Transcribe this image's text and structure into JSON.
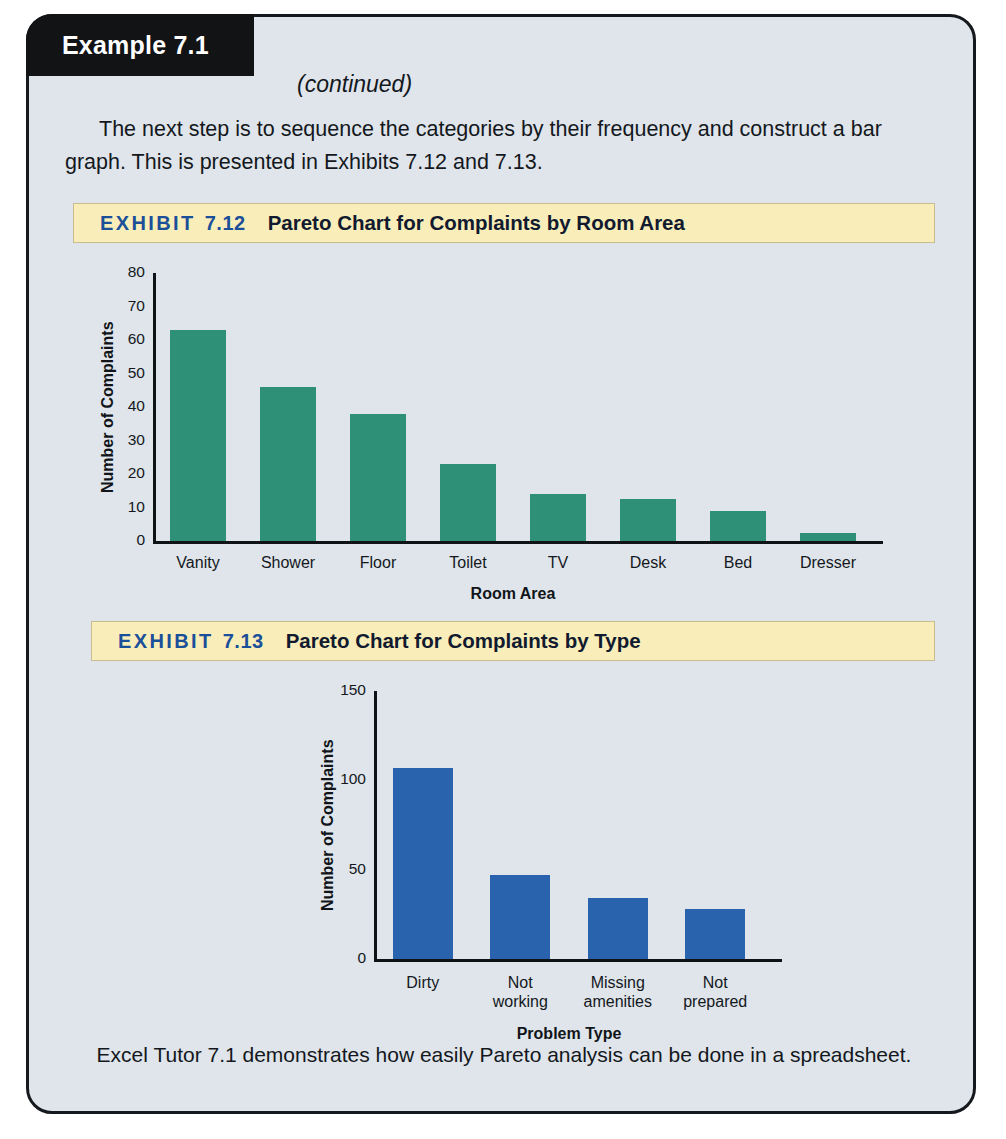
{
  "page": {
    "background_color": "#dfe5ea",
    "border_color": "#15181c"
  },
  "banner": {
    "label": "Example 7.1",
    "continued": "(continued)"
  },
  "intro": {
    "paragraph": "The next step is to sequence the categories by their frequency and construct a bar graph. This is presented in Exhibits 7.12 and 7.13."
  },
  "exhibits": [
    {
      "word": "EXHIBIT",
      "number": "7.12",
      "title": "Pareto Chart for Complaints by Room Area"
    },
    {
      "word": "EXHIBIT",
      "number": "7.13",
      "title": "Pareto Chart for Complaints by Type"
    }
  ],
  "footer": {
    "caption": "Excel Tutor 7.1 demonstrates how easily Pareto analysis can be done in a spreadsheet."
  },
  "chart_data": [
    {
      "type": "bar",
      "title": "Pareto Chart for Complaints by Room Area",
      "categories": [
        "Vanity",
        "Shower",
        "Floor",
        "Toilet",
        "TV",
        "Desk",
        "Bed",
        "Dresser"
      ],
      "values": [
        63,
        46,
        38,
        23,
        14,
        12.5,
        9,
        2.5
      ],
      "xlabel": "Room Area",
      "ylabel": "Number of Complaints",
      "ylim": [
        0,
        80
      ],
      "yticks": [
        0,
        10,
        20,
        30,
        40,
        50,
        60,
        70,
        80
      ],
      "ytick_labels": [
        "0",
        "10",
        "20",
        "30",
        "40",
        "50",
        "60",
        "70",
        "80"
      ],
      "bar_color": "#2d9077",
      "grid": false,
      "legend": null
    },
    {
      "type": "bar",
      "title": "Pareto Chart for Complaints by Type",
      "categories": [
        "Dirty",
        "Not working",
        "Missing amenities",
        "Not prepared"
      ],
      "values": [
        107,
        47,
        34,
        28
      ],
      "xlabel": "Problem Type",
      "ylabel": "Number of Complaints",
      "ylim": [
        0,
        150
      ],
      "yticks": [
        0,
        50,
        100,
        150
      ],
      "ytick_labels": [
        "0",
        "50",
        "100",
        "150"
      ],
      "bar_color": "#2a63ad",
      "grid": false,
      "legend": null
    }
  ]
}
